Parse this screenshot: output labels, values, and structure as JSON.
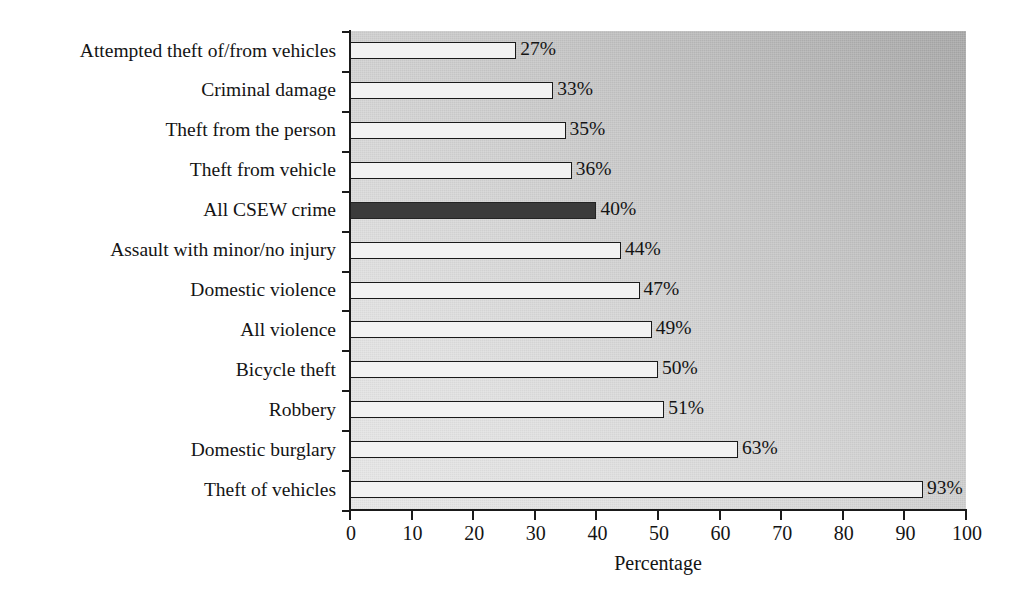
{
  "chart_data": {
    "type": "bar",
    "orientation": "horizontal",
    "title": "",
    "xlabel": "Percentage",
    "ylabel": "",
    "xlim": [
      0,
      100
    ],
    "xticks": [
      "0",
      "10",
      "20",
      "30",
      "40",
      "50",
      "60",
      "70",
      "80",
      "90",
      "100"
    ],
    "grid": false,
    "legend": null,
    "categories": [
      "Attempted theft of/from vehicles",
      "Criminal damage",
      "Theft from the person",
      "Theft from vehicle",
      "All CSEW crime",
      "Assault with minor/no injury",
      "Domestic violence",
      "All violence",
      "Bicycle theft",
      "Robbery",
      "Domestic burglary",
      "Theft of vehicles"
    ],
    "values": [
      27,
      33,
      35,
      36,
      40,
      44,
      47,
      49,
      50,
      51,
      63,
      93
    ],
    "value_labels": [
      "27%",
      "33%",
      "35%",
      "36%",
      "40%",
      "44%",
      "47%",
      "49%",
      "50%",
      "51%",
      "63%",
      "93%"
    ],
    "highlighted_index": 4,
    "colors": {
      "bar_fill": "#f2f2f2",
      "bar_edge": "#1a1a1a",
      "highlight_fill": "#3b3b3b",
      "plot_background_light": "#e7e7e7",
      "plot_background_dark": "#a6a6a6",
      "text": "#141414"
    }
  }
}
